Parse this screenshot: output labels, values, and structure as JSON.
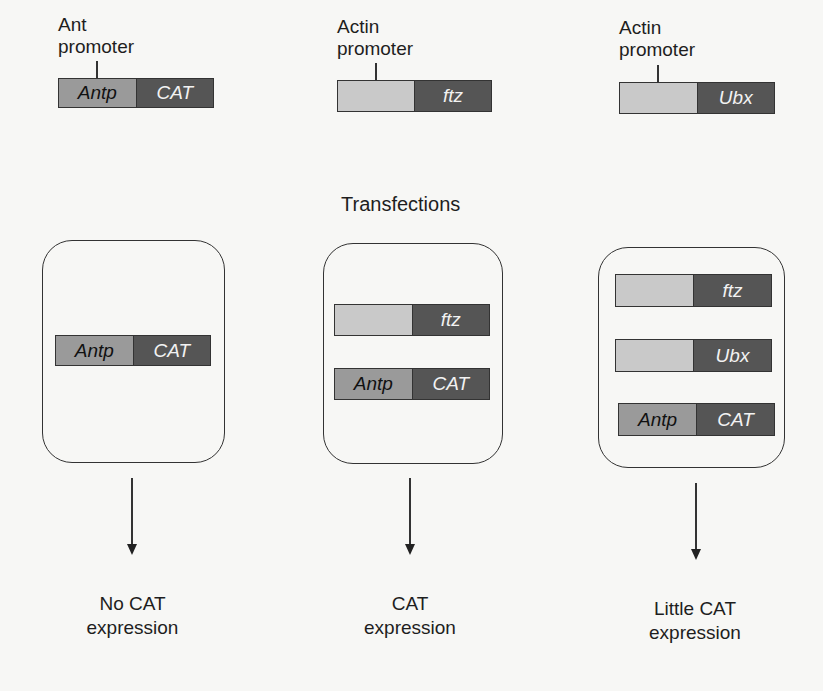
{
  "colors": {
    "antp_segment": "#9a9a9a",
    "actin_promoter_segment": "#c9c9c9",
    "coding_segment_dark": "#555555",
    "outline": "#333333",
    "background": "#f7f7f5"
  },
  "top_constructs": [
    {
      "promoter_label_line1": "Ant",
      "promoter_label_line2": "promoter",
      "left_segment": "Antp",
      "right_segment": "CAT"
    },
    {
      "promoter_label_line1": "Actin",
      "promoter_label_line2": "promoter",
      "left_segment": "",
      "right_segment": "ftz"
    },
    {
      "promoter_label_line1": "Actin",
      "promoter_label_line2": "promoter",
      "left_segment": "",
      "right_segment": "Ubx"
    }
  ],
  "section_title": "Transfections",
  "transfections": [
    {
      "constructs": [
        {
          "left": "Antp",
          "right": "CAT"
        }
      ],
      "result_line1": "No CAT",
      "result_line2": "expression"
    },
    {
      "constructs": [
        {
          "left": "",
          "right": "ftz"
        },
        {
          "left": "Antp",
          "right": "CAT"
        }
      ],
      "result_line1": "CAT",
      "result_line2": "expression"
    },
    {
      "constructs": [
        {
          "left": "",
          "right": "ftz"
        },
        {
          "left": "",
          "right": "Ubx"
        },
        {
          "left": "Antp",
          "right": "CAT"
        }
      ],
      "result_line1": "Little CAT",
      "result_line2": "expression"
    }
  ]
}
